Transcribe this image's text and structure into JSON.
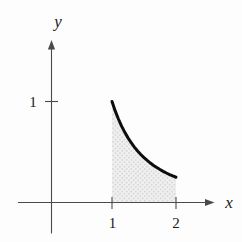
{
  "figure": {
    "labels": {
      "x_axis": "x",
      "y_axis": "y",
      "y_tick_1": "1",
      "x_tick_1": "1",
      "x_tick_2": "2"
    },
    "colors": {
      "axis": "#4a4a4a",
      "curve": "#0d0d0d",
      "text": "#1a1a1a",
      "shade_base": "#f1f1f1",
      "shade_dot": "#cfcfcf",
      "background": "#fdfdfd"
    }
  },
  "chart_data": {
    "type": "area",
    "title": "",
    "xlabel": "x",
    "ylabel": "y",
    "function": "y = 1/x^2",
    "x_ticks": [
      {
        "value": 1,
        "label": "1"
      },
      {
        "value": 2,
        "label": "2"
      }
    ],
    "y_ticks": [
      {
        "value": 1,
        "label": "1"
      }
    ],
    "shaded_interval": [
      1,
      2
    ],
    "curve_points": [
      [
        1.0,
        1.0
      ],
      [
        1.05,
        0.907
      ],
      [
        1.1,
        0.8264
      ],
      [
        1.15,
        0.7561
      ],
      [
        1.2,
        0.6944
      ],
      [
        1.25,
        0.64
      ],
      [
        1.3,
        0.5917
      ],
      [
        1.35,
        0.5487
      ],
      [
        1.4,
        0.5102
      ],
      [
        1.45,
        0.4756
      ],
      [
        1.5,
        0.4444
      ],
      [
        1.55,
        0.4162
      ],
      [
        1.6,
        0.3906
      ],
      [
        1.65,
        0.3673
      ],
      [
        1.7,
        0.346
      ],
      [
        1.75,
        0.3265
      ],
      [
        1.8,
        0.3086
      ],
      [
        1.85,
        0.2922
      ],
      [
        1.9,
        0.277
      ],
      [
        1.95,
        0.263
      ],
      [
        2.0,
        0.25
      ]
    ],
    "xlim": [
      0,
      2.5
    ],
    "ylim": [
      0,
      1.6
    ],
    "grid": false,
    "legend": null
  }
}
